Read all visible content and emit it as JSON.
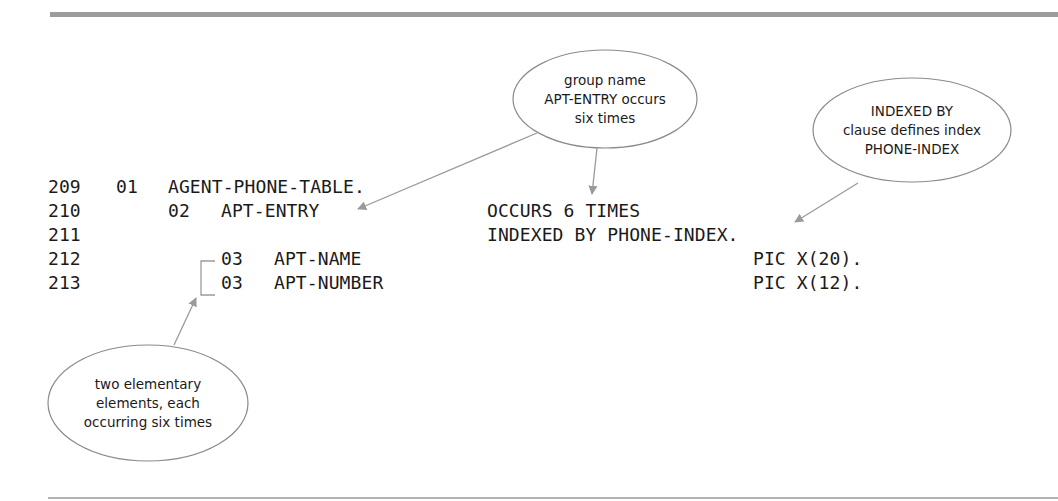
{
  "figure": {
    "code_lines": [
      {
        "line_number": "209",
        "level": "01",
        "name": "AGENT-PHONE-TABLE.",
        "clause": ""
      },
      {
        "line_number": "210",
        "level": "02",
        "name": "APT-ENTRY",
        "clause": "OCCURS 6 TIMES"
      },
      {
        "line_number": "211",
        "level": "",
        "name": "",
        "clause": "INDEXED BY PHONE-INDEX."
      },
      {
        "line_number": "212",
        "level": "03",
        "name": "APT-NAME",
        "clause": "PIC X(20)."
      },
      {
        "line_number": "213",
        "level": "03",
        "name": "APT-NUMBER",
        "clause": "PIC X(12)."
      }
    ],
    "callouts": [
      {
        "id": "group-name",
        "lines": [
          "group name",
          "APT-ENTRY occurs",
          "six times"
        ]
      },
      {
        "id": "indexed-by",
        "lines": [
          "INDEXED BY",
          "clause defines index",
          "PHONE-INDEX"
        ]
      },
      {
        "id": "elementary",
        "lines": [
          "two elementary",
          "elements, each",
          "occurring six times"
        ]
      }
    ],
    "colors": {
      "rule": "#9c9c9c",
      "arrow": "#9a9a9a",
      "bubble_border": "#8a8a8a",
      "text": "#1a1a1a"
    }
  }
}
